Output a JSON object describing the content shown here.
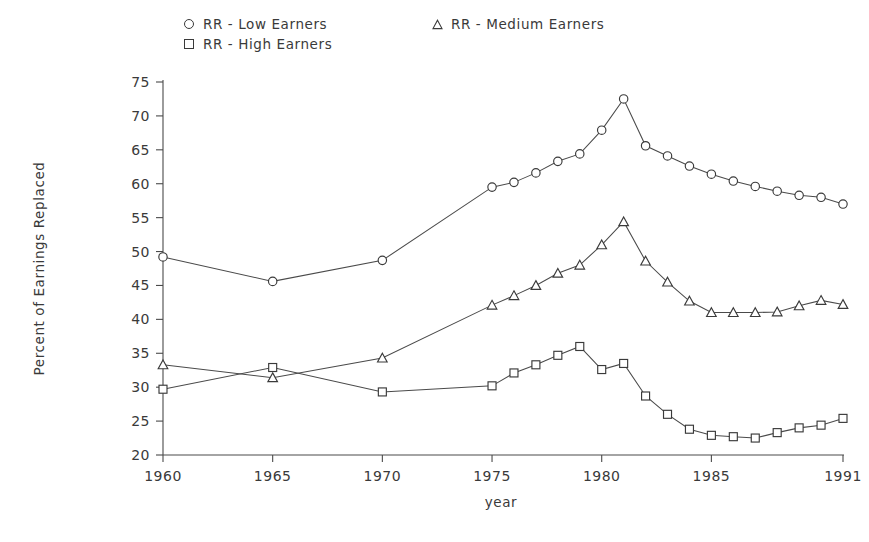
{
  "chart_data": {
    "type": "line",
    "title": "",
    "xlabel": "year",
    "ylabel": "Percent of Earnings Replaced",
    "xlim": [
      1960,
      1991
    ],
    "ylim": [
      20,
      75
    ],
    "yticks": [
      20,
      25,
      30,
      35,
      40,
      45,
      50,
      55,
      60,
      65,
      70,
      75
    ],
    "xticks": [
      1960,
      1965,
      1970,
      1975,
      1980,
      1985,
      1991
    ],
    "grid": false,
    "legend_position": "above-plot",
    "x": [
      1960,
      1965,
      1970,
      1975,
      1976,
      1977,
      1978,
      1979,
      1980,
      1981,
      1982,
      1983,
      1984,
      1985,
      1986,
      1987,
      1988,
      1989,
      1990,
      1991
    ],
    "series": [
      {
        "name": "RR - Low Earners",
        "marker": "circle",
        "values": [
          49.2,
          45.6,
          48.7,
          59.5,
          60.2,
          61.6,
          63.3,
          64.4,
          67.9,
          72.5,
          65.6,
          64.1,
          62.6,
          61.4,
          60.4,
          59.6,
          58.9,
          58.3,
          58.0,
          57.0
        ]
      },
      {
        "name": "RR - Medium Earners",
        "marker": "triangle",
        "values": [
          33.3,
          31.4,
          34.3,
          42.1,
          43.5,
          45.0,
          46.8,
          48.0,
          51.0,
          54.4,
          48.6,
          45.5,
          42.7,
          41.0,
          41.0,
          41.0,
          41.1,
          42.0,
          42.8,
          42.2
        ]
      },
      {
        "name": "RR - High Earners",
        "marker": "square",
        "values": [
          29.7,
          32.9,
          29.3,
          30.2,
          32.1,
          33.3,
          34.7,
          36.0,
          32.6,
          33.5,
          28.7,
          26.0,
          23.8,
          22.9,
          22.7,
          22.5,
          23.3,
          24.0,
          24.4,
          25.4
        ]
      }
    ]
  },
  "legend": {
    "entries": [
      {
        "marker": "circle-marker-icon",
        "label": "RR  -  Low Earners"
      },
      {
        "marker": "square-marker-icon",
        "label": "RR  -  High Earners"
      },
      {
        "marker": "triangle-marker-icon",
        "label": "RR  -  Medium Earners"
      }
    ]
  },
  "axes": {
    "y_title": "Percent of Earnings Replaced",
    "x_title": "year",
    "y_tick_labels": [
      "75",
      "70",
      "65",
      "60",
      "55",
      "50",
      "45",
      "40",
      "35",
      "30",
      "25",
      "20"
    ],
    "x_tick_labels": [
      "1960",
      "1965",
      "1970",
      "1975",
      "1980",
      "1985",
      "1991"
    ]
  },
  "colors": {
    "ink": "#3a3a3a",
    "axis": "#4a4a4a",
    "background": "#ffffff"
  }
}
